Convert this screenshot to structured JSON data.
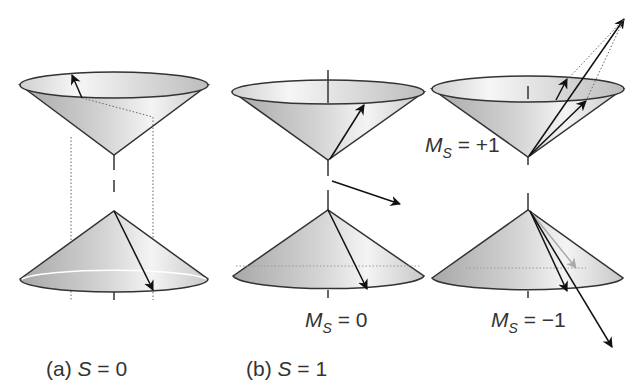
{
  "figure": {
    "panels": [
      {
        "id": "a",
        "label_prefix": "(a) ",
        "label_var": "S",
        "label_eq": " = 0"
      },
      {
        "id": "b",
        "label_prefix": "(b) ",
        "label_var": "S",
        "label_eq": " = 1"
      }
    ],
    "ms_labels": [
      {
        "var": "M",
        "sub": "S",
        "value": " = +1"
      },
      {
        "var": "M",
        "sub": "S",
        "value": " = 0"
      },
      {
        "var": "M",
        "sub": "S",
        "value": " = −1"
      }
    ]
  }
}
